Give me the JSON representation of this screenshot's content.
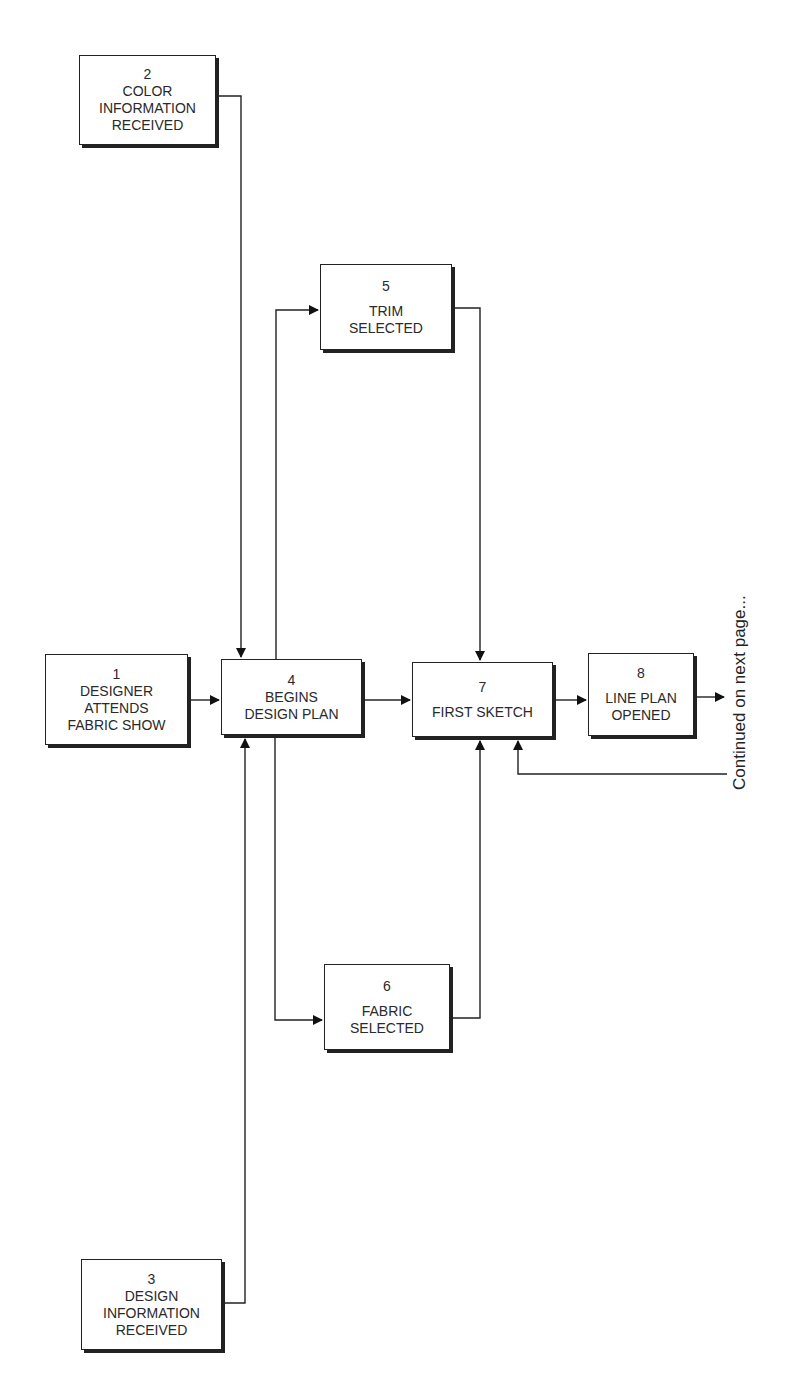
{
  "diagram": {
    "type": "flowchart",
    "nodes": [
      {
        "id": "1",
        "number": "1",
        "label": "DESIGNER\nATTENDS\nFABRIC SHOW"
      },
      {
        "id": "2",
        "number": "2",
        "label": "COLOR\nINFORMATION\nRECEIVED"
      },
      {
        "id": "3",
        "number": "3",
        "label": "DESIGN\nINFORMATION\nRECEIVED"
      },
      {
        "id": "4",
        "number": "4",
        "label": "BEGINS\nDESIGN PLAN"
      },
      {
        "id": "5",
        "number": "5",
        "label": "TRIM\nSELECTED"
      },
      {
        "id": "6",
        "number": "6",
        "label": "FABRIC\nSELECTED"
      },
      {
        "id": "7",
        "number": "7",
        "label": "FIRST SKETCH"
      },
      {
        "id": "8",
        "number": "8",
        "label": "LINE PLAN\nOPENED"
      }
    ],
    "edges": [
      {
        "from": "1",
        "to": "4"
      },
      {
        "from": "2",
        "to": "4"
      },
      {
        "from": "3",
        "to": "4"
      },
      {
        "from": "4",
        "to": "5"
      },
      {
        "from": "4",
        "to": "6"
      },
      {
        "from": "4",
        "to": "7"
      },
      {
        "from": "5",
        "to": "7"
      },
      {
        "from": "6",
        "to": "7"
      },
      {
        "from": "7",
        "to": "8"
      },
      {
        "from": "8",
        "to": "next-page"
      },
      {
        "from": "next-page",
        "to": "7"
      }
    ],
    "continuation_note": "Continued on next page..."
  }
}
